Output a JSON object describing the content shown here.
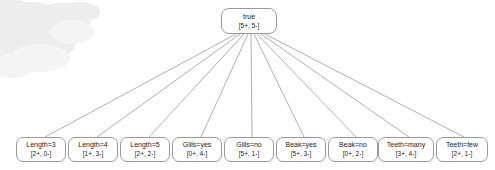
{
  "diagram": {
    "type": "decision-tree",
    "title": "",
    "root": {
      "label": "true",
      "counts": "[5+, 5-]",
      "positive": 5,
      "negative": 5
    },
    "leaves": [
      {
        "label": "Length=3",
        "counts": "[2+, 0-]",
        "positive": 2,
        "negative": 0,
        "x": 16,
        "width": 50
      },
      {
        "label": "Length=4",
        "counts": "[1+, 3-]",
        "positive": 1,
        "negative": 3,
        "x": 68,
        "width": 50
      },
      {
        "label": "Length=5",
        "counts": "[2+, 2-]",
        "positive": 2,
        "negative": 2,
        "x": 120,
        "width": 50
      },
      {
        "label": "Gills=yes",
        "counts": "[0+, 4-]",
        "positive": 0,
        "negative": 4,
        "x": 172,
        "width": 50
      },
      {
        "label": "Gills=no",
        "counts": "[5+, 1-]",
        "positive": 5,
        "negative": 1,
        "x": 224,
        "width": 50
      },
      {
        "label": "Beak=yes",
        "counts": "[5+, 3-]",
        "positive": 5,
        "negative": 3,
        "x": 276,
        "width": 50
      },
      {
        "label": "Beak=no",
        "counts": "[0+, 2-]",
        "positive": 0,
        "negative": 2,
        "x": 328,
        "width": 50
      },
      {
        "label": "Teeth=many",
        "counts": "[3+, 4-]",
        "positive": 3,
        "negative": 4,
        "x": 378,
        "width": 56
      },
      {
        "label": "Teeth=few",
        "counts": "[2+, 1-]",
        "positive": 2,
        "negative": 1,
        "x": 436,
        "width": 52
      }
    ],
    "colors": {
      "node_border": "#9a9a9a",
      "node_fill": "#ffffff",
      "edge": "#8d8d8d",
      "text": "#1c1c1c",
      "background": "#ffffff",
      "watermark": "#ededed"
    }
  }
}
